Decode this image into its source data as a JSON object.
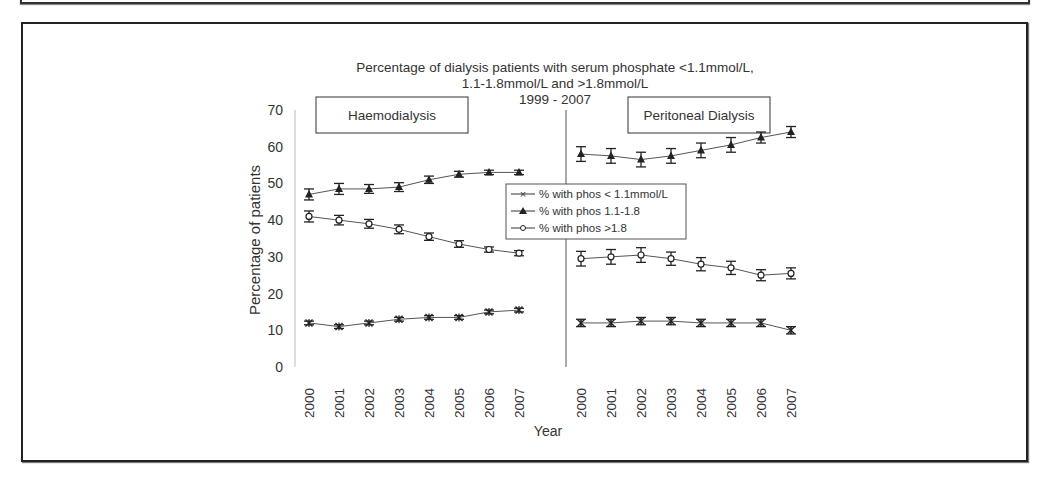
{
  "chart_data": {
    "type": "line",
    "title": "Percentage of dialysis patients with serum phosphate <1.1mmol/L, 1.1-1.8mmol/L and >1.8mmol/L 1999 - 2007",
    "title_lines": [
      "Percentage of dialysis patients with serum phosphate <1.1mmol/L,",
      "1.1-1.8mmol/L and >1.8mmol/L",
      "1999 - 2007"
    ],
    "xlabel": "Year",
    "ylabel": "Percentage of patients",
    "ylim": [
      0,
      70
    ],
    "yticks": [
      0,
      10,
      20,
      30,
      40,
      50,
      60,
      70
    ],
    "grid": false,
    "legend_position": "center",
    "categories": [
      "2000",
      "2001",
      "2002",
      "2003",
      "2004",
      "2005",
      "2006",
      "2007"
    ],
    "legend": [
      {
        "label": "% with phos < 1.1mmol/L",
        "marker": "x"
      },
      {
        "label": "% with phos 1.1-1.8",
        "marker": "triangle"
      },
      {
        "label": "% with phos >1.8",
        "marker": "circle"
      }
    ],
    "panels": [
      {
        "name": "Haemodialysis",
        "series": [
          {
            "name": "% with phos < 1.1mmol/L",
            "values": [
              12,
              11,
              12,
              13,
              13.5,
              13.5,
              15,
              15.5
            ],
            "error": [
              0.5,
              0.5,
              0.5,
              0.5,
              0.5,
              0.5,
              0.5,
              0.5
            ]
          },
          {
            "name": "% with phos 1.1-1.8",
            "values": [
              47,
              48.5,
              48.5,
              49,
              51,
              52.5,
              53,
              53
            ],
            "error": [
              1.5,
              1.5,
              1.2,
              1.2,
              1,
              0.8,
              0.6,
              0.6
            ]
          },
          {
            "name": "% with phos >1.8",
            "values": [
              41,
              40,
              39,
              37.5,
              35.5,
              33.5,
              32,
              31
            ],
            "error": [
              1.5,
              1.3,
              1.2,
              1.2,
              1,
              0.9,
              0.7,
              0.7
            ]
          }
        ]
      },
      {
        "name": "Peritoneal Dialysis",
        "series": [
          {
            "name": "% with phos < 1.1mmol/L",
            "values": [
              12,
              12,
              12.5,
              12.5,
              12,
              12,
              12,
              10
            ],
            "error": [
              1,
              1,
              1,
              1,
              1,
              1,
              1,
              1
            ]
          },
          {
            "name": "% with phos 1.1-1.8",
            "values": [
              58,
              57.5,
              56.5,
              57.5,
              59,
              60.5,
              62.5,
              64
            ],
            "error": [
              2,
              2,
              2,
              2,
              2,
              2,
              1.5,
              1.5
            ]
          },
          {
            "name": "% with phos >1.8",
            "values": [
              29.5,
              30,
              30.5,
              29.5,
              28,
              27,
              25,
              25.5
            ],
            "error": [
              2,
              2,
              2,
              1.8,
              1.8,
              1.8,
              1.5,
              1.5
            ]
          }
        ]
      }
    ]
  }
}
